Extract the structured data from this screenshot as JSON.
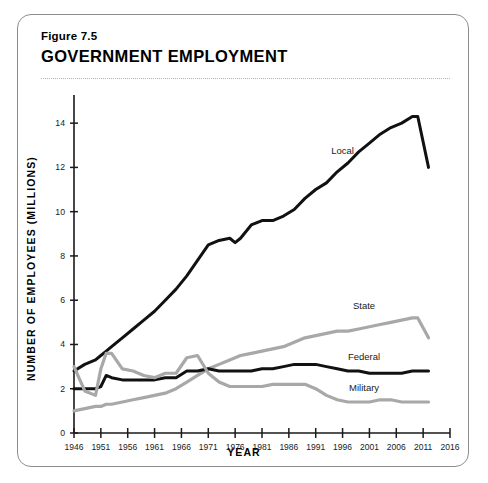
{
  "figure": {
    "number": "Figure 7.5",
    "title": "GOVERNMENT EMPLOYMENT"
  },
  "colors": {
    "dark_series": "#111111",
    "light_series": "#a8a8a8",
    "axis": "#1a1a1a",
    "card_border": "#8d8d8d",
    "rule": "#b4b4b4",
    "background": "#ffffff"
  },
  "chart_data": {
    "type": "line",
    "title": "GOVERNMENT EMPLOYMENT",
    "xlabel": "YEAR",
    "ylabel": "NUMBER OF EMPLOYEES (MILLIONS)",
    "xlim": [
      1946,
      2016
    ],
    "ylim": [
      0,
      15
    ],
    "xticks": [
      1946,
      1951,
      1956,
      1961,
      1966,
      1971,
      1976,
      1981,
      1986,
      1991,
      1996,
      2001,
      2006,
      2011,
      2016
    ],
    "yticks": [
      0,
      2,
      4,
      6,
      8,
      10,
      12,
      14
    ],
    "grid": false,
    "legend": "inline-labels",
    "x": [
      1946,
      1948,
      1950,
      1951,
      1952,
      1953,
      1955,
      1957,
      1959,
      1961,
      1963,
      1965,
      1967,
      1969,
      1971,
      1973,
      1975,
      1976,
      1977,
      1979,
      1981,
      1983,
      1985,
      1987,
      1989,
      1991,
      1993,
      1995,
      1997,
      1999,
      2001,
      2003,
      2005,
      2007,
      2009,
      2010,
      2012
    ],
    "series": [
      {
        "name": "Local",
        "color": "#111111",
        "label_x": 1996,
        "label_y": 12.6,
        "values": [
          2.8,
          3.1,
          3.3,
          3.5,
          3.7,
          3.9,
          4.3,
          4.7,
          5.1,
          5.5,
          6.0,
          6.5,
          7.1,
          7.8,
          8.5,
          8.7,
          8.8,
          8.6,
          8.8,
          9.4,
          9.6,
          9.6,
          9.8,
          10.1,
          10.6,
          11.0,
          11.3,
          11.8,
          12.2,
          12.7,
          13.1,
          13.5,
          13.8,
          14.0,
          14.3,
          14.3,
          12.0
        ]
      },
      {
        "name": "State",
        "color": "#a8a8a8",
        "label_x": 2000,
        "label_y": 5.6,
        "values": [
          1.0,
          1.1,
          1.2,
          1.2,
          1.3,
          1.3,
          1.4,
          1.5,
          1.6,
          1.7,
          1.8,
          2.0,
          2.3,
          2.6,
          2.9,
          3.1,
          3.3,
          3.4,
          3.5,
          3.6,
          3.7,
          3.8,
          3.9,
          4.1,
          4.3,
          4.4,
          4.5,
          4.6,
          4.6,
          4.7,
          4.8,
          4.9,
          5.0,
          5.1,
          5.2,
          5.2,
          4.3
        ]
      },
      {
        "name": "Federal",
        "color": "#111111",
        "label_x": 2000,
        "label_y": 3.3,
        "values": [
          2.0,
          2.0,
          2.0,
          2.1,
          2.6,
          2.5,
          2.4,
          2.4,
          2.4,
          2.4,
          2.5,
          2.5,
          2.8,
          2.8,
          2.9,
          2.8,
          2.8,
          2.8,
          2.8,
          2.8,
          2.9,
          2.9,
          3.0,
          3.1,
          3.1,
          3.1,
          3.0,
          2.9,
          2.8,
          2.8,
          2.7,
          2.7,
          2.7,
          2.7,
          2.8,
          2.8,
          2.8
        ]
      },
      {
        "name": "Military",
        "color": "#a8a8a8",
        "label_x": 2000,
        "label_y": 1.9,
        "values": [
          3.0,
          1.9,
          1.7,
          2.9,
          3.6,
          3.6,
          2.9,
          2.8,
          2.6,
          2.5,
          2.7,
          2.7,
          3.4,
          3.5,
          2.7,
          2.3,
          2.1,
          2.1,
          2.1,
          2.1,
          2.1,
          2.2,
          2.2,
          2.2,
          2.2,
          2.0,
          1.7,
          1.5,
          1.4,
          1.4,
          1.4,
          1.5,
          1.5,
          1.4,
          1.4,
          1.4,
          1.4
        ]
      }
    ]
  }
}
